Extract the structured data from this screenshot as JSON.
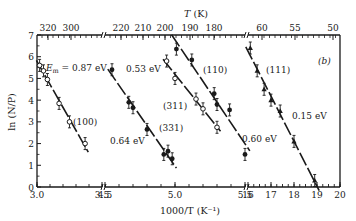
{
  "chart_data": {
    "type": "scatter",
    "title": "",
    "panel_label": "(b)",
    "xlabel": "1000/T (K⁻¹)",
    "ylabel": "ln (N/P)",
    "top_xlabel": "T (K)",
    "ylim": [
      0,
      7
    ],
    "yticks": [
      0,
      1,
      2,
      3,
      4,
      5,
      6,
      7
    ],
    "grid": false,
    "broken_x_axis": true,
    "x_segments": [
      {
        "range": [
          3.0,
          3.5
        ],
        "ticks": [
          "3.0",
          "3.5"
        ],
        "top_ticks": [
          "320",
          "300"
        ]
      },
      {
        "range": [
          4.5,
          5.5
        ],
        "ticks": [
          "4.5",
          "5.0",
          "5.5"
        ],
        "top_ticks": [
          "220",
          "210",
          "200",
          "190",
          "180"
        ]
      },
      {
        "range": [
          16,
          20
        ],
        "ticks": [
          "16",
          "17",
          "18",
          "19",
          "20"
        ],
        "top_ticks": [
          "60",
          "55",
          "50"
        ]
      }
    ],
    "series": [
      {
        "name": "(100)",
        "marker": "open-circle",
        "segment": 0,
        "energy_label": "E_m = 0.87 eV",
        "x": [
          3.02,
          3.05,
          3.08,
          3.17,
          3.25,
          3.37
        ],
        "y": [
          5.6,
          5.35,
          4.95,
          3.85,
          3.0,
          2.0
        ]
      },
      {
        "name": "(331)",
        "marker": "filled-circle",
        "segment": 1,
        "energy_label": "0.64 eV",
        "x": [
          4.55,
          4.67,
          4.7,
          4.8,
          4.92,
          4.95,
          4.98
        ],
        "y": [
          5.4,
          3.9,
          3.65,
          2.65,
          1.5,
          1.65,
          1.3
        ]
      },
      {
        "name": "(311)",
        "marker": "open-circle",
        "segment": 1,
        "energy_label": "0.53 eV",
        "x": [
          4.94,
          5.0,
          5.15,
          5.2,
          5.3
        ],
        "y": [
          5.8,
          5.0,
          4.05,
          3.6,
          2.75
        ]
      },
      {
        "name": "(110)",
        "marker": "filled-circle",
        "segment": 1,
        "energy_label": "0.60 eV",
        "x": [
          5.01,
          5.12,
          5.28,
          5.3,
          5.39,
          5.5
        ],
        "y": [
          6.35,
          5.85,
          4.3,
          3.8,
          3.55,
          1.5
        ]
      },
      {
        "name": "(111)",
        "marker": "filled-triangle",
        "segment": 2,
        "energy_label": "0.15 eV",
        "x": [
          16.1,
          16.4,
          16.7,
          17.0,
          17.4,
          18.0,
          18.9
        ],
        "y": [
          6.4,
          5.35,
          4.5,
          4.0,
          3.5,
          2.1,
          0.3
        ]
      }
    ],
    "fit_lines": [
      {
        "series": "(100)",
        "slope_eV": 0.87
      },
      {
        "series": "(331)",
        "slope_eV": 0.64
      },
      {
        "series": "(311)",
        "slope_eV": 0.53
      },
      {
        "series": "(110)",
        "slope_eV": 0.6
      },
      {
        "series": "(111)",
        "slope_eV": 0.15
      }
    ]
  },
  "labels": {
    "panel": "(b)",
    "xlabel": "1000/T (K⁻¹)",
    "ylabel": "ln (N/P)",
    "top_xlabel_T": "T",
    "top_xlabel_unit": " (K)",
    "em_label": "E",
    "em_sub": "m",
    "em_value": " = 0.87 eV",
    "e053": "0.53 eV",
    "e064": "0.64 eV",
    "e060": "0.60 eV",
    "e015": "0.15 eV",
    "s100": "(100)",
    "s331": "(331)",
    "s311": "(311)",
    "s110": "(110)",
    "s111": "(111)"
  }
}
